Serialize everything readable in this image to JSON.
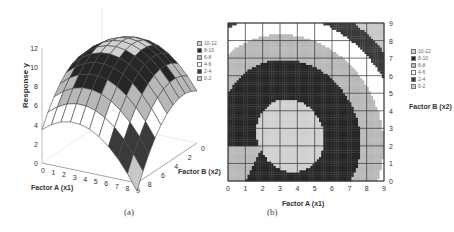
{
  "figure": {
    "caption_a": "(a)",
    "caption_b": "(b)"
  },
  "legend": {
    "entries": [
      {
        "label": "10-12",
        "color": "#d0d0d0"
      },
      {
        "label": "8-10",
        "color": "#262626"
      },
      {
        "label": "6-8",
        "color": "#b8b8b8"
      },
      {
        "label": "4-6",
        "color": "#ffffff"
      },
      {
        "label": "2-4",
        "color": "#3a3a3a"
      },
      {
        "label": "0-2",
        "color": "#c8c8c8"
      }
    ]
  },
  "chart_data": [
    {
      "type": "surface3d",
      "title": "",
      "xlabel": "Factor A (x1)",
      "ylabel": "Factor B (x2)",
      "zlabel": "Response y",
      "x_ticks": [
        "0",
        "1",
        "2",
        "3",
        "4",
        "5",
        "6",
        "7",
        "8",
        "9"
      ],
      "y_ticks": [
        "0",
        "2",
        "4",
        "6",
        "8"
      ],
      "z_ticks": [
        "0",
        "2",
        "4",
        "6",
        "8",
        "10",
        "12"
      ],
      "zlim": [
        0,
        12
      ],
      "legend": [
        "10-12",
        "8-10",
        "6-8",
        "4-6",
        "2-4",
        "0-2"
      ],
      "surface_peak": {
        "x1": 4,
        "x2": 3,
        "y": 10.5
      },
      "corner_values": {
        "x1_0_x2_0": 7.5,
        "x1_9_x2_0": 3.5,
        "x1_0_x2_9": 3.0,
        "x1_9_x2_9": 2.5
      },
      "caption": "(a)"
    },
    {
      "type": "contour",
      "title": "",
      "xlabel": "Factor A (x1)",
      "ylabel": "Factor B (x2)",
      "x_ticks": [
        "0",
        "1",
        "2",
        "3",
        "4",
        "5",
        "6",
        "7",
        "8",
        "9"
      ],
      "y_ticks": [
        "0",
        "1",
        "2",
        "3",
        "4",
        "5",
        "6",
        "7",
        "8",
        "9"
      ],
      "xlim": [
        0,
        9
      ],
      "ylim": [
        0,
        9
      ],
      "grid": true,
      "levels": [
        "0-2",
        "2-4",
        "4-6",
        "6-8",
        "8-10",
        "10-12"
      ],
      "regions": [
        {
          "level": "8-10",
          "approx_extent": "x1 0-5.3, x2 0-6.3, dark core"
        },
        {
          "level": "6-8",
          "approx_extent": "x1 0-8.3, x2 0-8.4 ring around core, plus bottom-left patch x1 0-2, x2 0-2"
        },
        {
          "level": "4-6",
          "approx_extent": "outer band near top-left and bottom-right"
        },
        {
          "level": "2-4",
          "approx_extent": "small corners at (0,9), (9,9), (9,0)"
        }
      ],
      "legend": [
        "10-12",
        "8-10",
        "6-8",
        "4-6",
        "2-4",
        "0-2"
      ],
      "caption": "(b)"
    }
  ]
}
